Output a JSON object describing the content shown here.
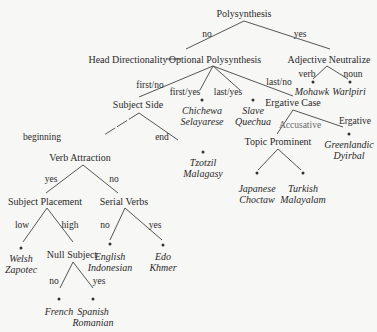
{
  "diagram": {
    "type": "decision-tree",
    "root": "Polysynthesis",
    "nodes": {
      "polysynthesis": "Polysynthesis",
      "head_directionality": "Head Directionality",
      "optional_polysynthesis": "Optional Polysynthesis",
      "adjective_neutralize": "Adjective Neutralize",
      "subject_side": "Subject Side",
      "ergative_case": "Ergative Case",
      "verb_attraction": "Verb Attraction",
      "topic_prominent": "Topic Prominent",
      "subject_placement": "Subject Placement",
      "serial_verbs": "Serial Verbs",
      "null_subject": "Null Subject"
    },
    "edge_labels": {
      "poly_no": "no",
      "poly_yes": "yes",
      "adj_verb": "verb",
      "adj_noun": "noun",
      "opt_first_no": "first/no",
      "opt_first_yes": "first/yes",
      "opt_last_yes": "last/yes",
      "opt_last_no": "last/no",
      "subj_beginning": "beginning",
      "subj_end": "end",
      "erg_accusative": "Accusative",
      "erg_ergative": "Ergative",
      "verb_yes": "yes",
      "verb_no": "no",
      "place_low": "low",
      "place_high": "high",
      "serial_no": "no",
      "serial_yes": "yes",
      "null_no": "no",
      "null_yes": "yes"
    },
    "leaves": {
      "mohawk": [
        "Mohawk"
      ],
      "warlpiri": [
        "Warlpiri"
      ],
      "chichewa": [
        "Chichewa",
        "Selayarese"
      ],
      "slave": [
        "Slave",
        "Quechua"
      ],
      "tzotzil": [
        "Tzotzil",
        "Malagasy"
      ],
      "greenlandic": [
        "Greenlandic",
        "Dyirbal"
      ],
      "japanese": [
        "Japanese",
        "Choctaw"
      ],
      "turkish": [
        "Turkish",
        "Malayalam"
      ],
      "welsh": [
        "Welsh",
        "Zapotec"
      ],
      "english": [
        "English",
        "Indonesian"
      ],
      "edo": [
        "Edo",
        "Khmer"
      ],
      "french": [
        "French"
      ],
      "spanish": [
        "Spanish",
        "Romanian"
      ]
    }
  }
}
